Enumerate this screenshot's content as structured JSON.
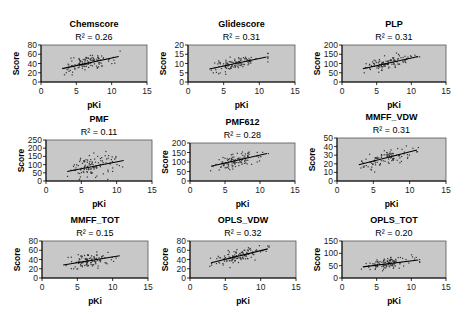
{
  "figure": {
    "panel_count": 9,
    "layout": "3x3 grid",
    "plot_background": "#c8c8c8",
    "point_color": "#333333",
    "line_color": "#000000"
  },
  "chart_data": [
    {
      "type": "scatter",
      "title": "Chemscore",
      "annotation": "R² = 0.26",
      "r2": 0.26,
      "xlabel": "pKi",
      "ylabel": "Score",
      "xlim": [
        0,
        15
      ],
      "ylim": [
        0,
        80
      ],
      "xticks": [
        "0",
        "5",
        "10",
        "15"
      ],
      "yticks": [
        "0",
        "20",
        "40",
        "60",
        "80"
      ],
      "trendline": {
        "x": [
          3,
          11
        ],
        "y": [
          29,
          55
        ]
      },
      "point_x_range": [
        2.8,
        11.2
      ],
      "point_count": 120,
      "residual_spread": 10,
      "seed": 11
    },
    {
      "type": "scatter",
      "title": "Glidescore",
      "annotation": "R² = 0.31",
      "r2": 0.31,
      "xlabel": "pKi",
      "ylabel": "Score",
      "xlim": [
        0,
        15
      ],
      "ylim": [
        0,
        20
      ],
      "xticks": [
        "0",
        "5",
        "10",
        "15"
      ],
      "yticks": [
        "0",
        "5",
        "10",
        "15",
        "20"
      ],
      "trendline": {
        "x": [
          3,
          11
        ],
        "y": [
          7,
          13.5
        ]
      },
      "point_x_range": [
        2.8,
        11.2
      ],
      "point_count": 110,
      "residual_spread": 2.2,
      "seed": 23
    },
    {
      "type": "scatter",
      "title": "PLP",
      "annotation": "R² = 0.31",
      "r2": 0.31,
      "xlabel": "pKi",
      "ylabel": "Score",
      "xlim": [
        0,
        15
      ],
      "ylim": [
        0,
        200
      ],
      "xticks": [
        "0",
        "5",
        "10",
        "15"
      ],
      "yticks": [
        "0",
        "50",
        "100",
        "150",
        "200"
      ],
      "trendline": {
        "x": [
          3,
          11
        ],
        "y": [
          72,
          138
        ]
      },
      "point_x_range": [
        2.8,
        11.2
      ],
      "point_count": 110,
      "residual_spread": 22,
      "seed": 37
    },
    {
      "type": "scatter",
      "title": "PMF",
      "annotation": "R² = 0.11",
      "r2": 0.11,
      "xlabel": "pKi",
      "ylabel": "Score",
      "xlim": [
        0,
        15
      ],
      "ylim": [
        0,
        250
      ],
      "xticks": [
        "0",
        "5",
        "10",
        "15"
      ],
      "yticks": [
        "0",
        "50",
        "100",
        "150",
        "200",
        "250"
      ],
      "trendline": {
        "x": [
          3,
          11
        ],
        "y": [
          58,
          125
        ]
      },
      "point_x_range": [
        2.8,
        11.2
      ],
      "point_count": 110,
      "residual_spread": 40,
      "seed": 41
    },
    {
      "type": "scatter",
      "title": "PMF612",
      "annotation": "R² = 0.28",
      "r2": 0.28,
      "xlabel": "pKi",
      "ylabel": "Score",
      "xlim": [
        0,
        15
      ],
      "ylim": [
        0,
        200
      ],
      "xticks": [
        "0",
        "5",
        "10",
        "15"
      ],
      "yticks": [
        "0",
        "50",
        "100",
        "150",
        "200"
      ],
      "trendline": {
        "x": [
          3,
          11
        ],
        "y": [
          78,
          145
        ]
      },
      "point_x_range": [
        2.8,
        11.2
      ],
      "point_count": 110,
      "residual_spread": 24,
      "seed": 53
    },
    {
      "type": "scatter",
      "title": "MMFF_VDW",
      "annotation": "R² = 0.31",
      "r2": 0.31,
      "xlabel": "pKi",
      "ylabel": "Score",
      "xlim": [
        0,
        15
      ],
      "ylim": [
        0,
        50
      ],
      "xticks": [
        "0",
        "5",
        "10",
        "15"
      ],
      "yticks": [
        "0",
        "10",
        "20",
        "30",
        "40",
        "50"
      ],
      "trendline": {
        "x": [
          3,
          11
        ],
        "y": [
          19,
          36
        ]
      },
      "point_x_range": [
        2.8,
        11.2
      ],
      "point_count": 100,
      "residual_spread": 5.5,
      "seed": 67
    },
    {
      "type": "scatter",
      "title": "MMFF_TOT",
      "annotation": "R² = 0.15",
      "r2": 0.15,
      "xlabel": "pKi",
      "ylabel": "Score",
      "xlim": [
        0,
        15
      ],
      "ylim": [
        0,
        80
      ],
      "xticks": [
        "0",
        "5",
        "10",
        "15"
      ],
      "yticks": [
        "0",
        "20",
        "40",
        "60",
        "80"
      ],
      "trendline": {
        "x": [
          3,
          11
        ],
        "y": [
          28,
          48
        ]
      },
      "point_x_range": [
        2.8,
        11.2
      ],
      "point_count": 110,
      "residual_spread": 9,
      "seed": 71
    },
    {
      "type": "scatter",
      "title": "OPLS_VDW",
      "annotation": "R² = 0.32",
      "r2": 0.32,
      "xlabel": "pKi",
      "ylabel": "Score",
      "xlim": [
        0,
        15
      ],
      "ylim": [
        0,
        80
      ],
      "xticks": [
        "0",
        "5",
        "10",
        "15"
      ],
      "yticks": [
        "0",
        "20",
        "40",
        "60",
        "80"
      ],
      "trendline": {
        "x": [
          3,
          11
        ],
        "y": [
          33,
          63
        ]
      },
      "point_x_range": [
        2.8,
        11.2
      ],
      "point_count": 115,
      "residual_spread": 9,
      "seed": 83
    },
    {
      "type": "scatter",
      "title": "OPLS_TOT",
      "annotation": "R² = 0.20",
      "r2": 0.2,
      "xlabel": "pKi",
      "ylabel": "Score",
      "xlim": [
        0,
        15
      ],
      "ylim": [
        0,
        150
      ],
      "xticks": [
        "0",
        "5",
        "10",
        "15"
      ],
      "yticks": [
        "0",
        "50",
        "100",
        "150"
      ],
      "trendline": {
        "x": [
          3,
          11
        ],
        "y": [
          45,
          73
        ]
      },
      "point_x_range": [
        2.8,
        11.2
      ],
      "point_count": 105,
      "residual_spread": 14,
      "seed": 97
    }
  ]
}
